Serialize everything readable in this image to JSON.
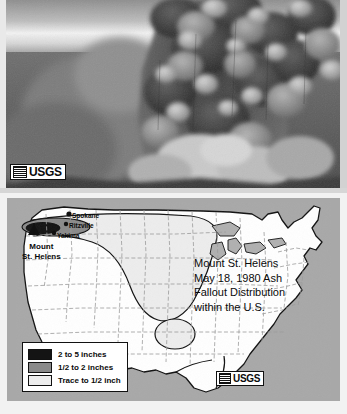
{
  "photo": {
    "alt": "Mount St. Helens eruption column of ash",
    "usgs": {
      "word": "USGS",
      "icon": "usgs-flag-icon"
    }
  },
  "map": {
    "title_lines": [
      "Mount St. Helens",
      "May 18, 1980 Ash",
      "Fallout Distribution",
      "within the U.S."
    ],
    "volcano_label_lines": [
      "Mount",
      "St. Helens"
    ],
    "cities": [
      {
        "name": "Spokane"
      },
      {
        "name": "Ritzville"
      },
      {
        "name": "Yakima"
      }
    ],
    "legend": {
      "items": [
        {
          "label": "2 to 5 inches",
          "color": "#141414"
        },
        {
          "label": "1/2 to 2 inches",
          "color": "#8a8a8a"
        },
        {
          "label": "Trace to 1/2 inch",
          "color": "#ededed"
        }
      ]
    },
    "usgs": {
      "word": "USGS",
      "icon": "usgs-flag-icon"
    },
    "colors": {
      "panel_background": "#a8a8a8",
      "land": "#ffffff",
      "outline": "#111111",
      "state_border": "#9a9a9a"
    }
  }
}
